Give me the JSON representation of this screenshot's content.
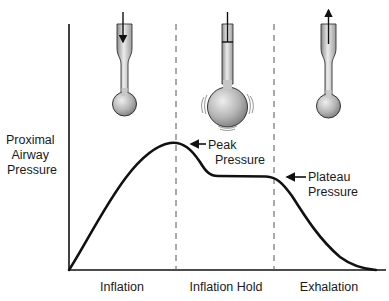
{
  "diagram": {
    "y_axis_label": [
      "Proximal",
      "Airway",
      "Pressure"
    ],
    "phases": [
      {
        "label": "Inflation",
        "lung_state": "filling",
        "airflow": "in"
      },
      {
        "label": "Inflation Hold",
        "lung_state": "distended",
        "airflow": "none"
      },
      {
        "label": "Exhalation",
        "lung_state": "emptying",
        "airflow": "out"
      }
    ],
    "annotations": [
      {
        "label_lines": [
          "Peak",
          "Pressure"
        ],
        "points_to": "peak"
      },
      {
        "label_lines": [
          "Plateau",
          "Pressure"
        ],
        "points_to": "plateau_end"
      }
    ],
    "curve_description": "Pressure rises from zero during inflation to a peak, falls to a plateau during inflation hold, then decays to zero during exhalation",
    "colors": {
      "line": "#111111",
      "lung_fill_light": "#e8e8e8",
      "lung_fill_dark": "#8a8a8a",
      "dash": "#555555"
    }
  }
}
